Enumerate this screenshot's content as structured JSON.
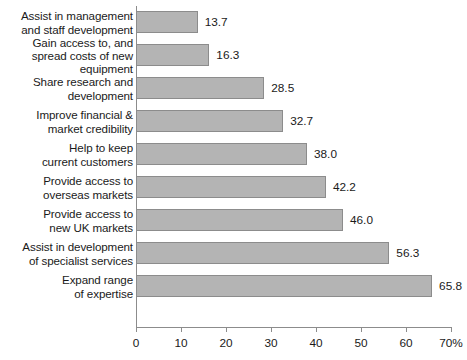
{
  "chart_data": {
    "type": "bar",
    "orientation": "horizontal",
    "title": "",
    "subtitle": "",
    "xlabel": "",
    "ylabel": "",
    "xlim": [
      0,
      70
    ],
    "grid": false,
    "legend": null,
    "bar_color": "#b4b4b4",
    "bar_border_color": "#8c8c8c",
    "axis_color": "#8c8c8c",
    "value_label_format": "one-decimal",
    "xticks": [
      0,
      10,
      20,
      30,
      40,
      50,
      60,
      70
    ],
    "xtick_labels": [
      "0",
      "10",
      "20",
      "30",
      "40",
      "50",
      "60",
      "70%"
    ],
    "categories": [
      "Assist in management\nand staff development",
      "Gain access to, and\nspread costs of new\nequipment",
      "Share research and\ndevelopment",
      "Improve financial &\nmarket credibility",
      "Help to keep\ncurrent customers",
      "Provide access to\noverseas markets",
      "Provide access to\nnew UK markets",
      "Assist in development\nof specialist services",
      "Expand range\nof expertise"
    ],
    "values": [
      13.7,
      16.3,
      28.5,
      32.7,
      38.0,
      42.2,
      46.0,
      56.3,
      65.8
    ],
    "value_labels": [
      "13.7",
      "16.3",
      "28.5",
      "32.7",
      "38.0",
      "42.2",
      "46.0",
      "56.3",
      "65.8"
    ]
  }
}
